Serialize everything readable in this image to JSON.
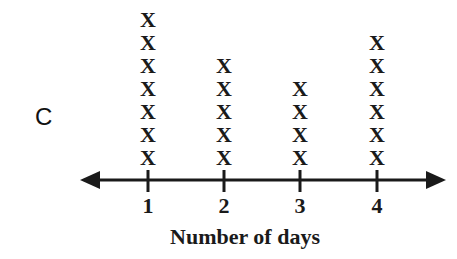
{
  "panel_label": "C",
  "chart_data": {
    "type": "line-plot",
    "marker": "X",
    "title": "",
    "xlabel": "Number of days",
    "ylabel": "",
    "categories": [
      "1",
      "2",
      "3",
      "4"
    ],
    "values": [
      7,
      5,
      4,
      6
    ],
    "axis": {
      "arrows": "both",
      "grid": false
    }
  },
  "layout": {
    "tick_x": [
      148,
      224,
      300,
      377
    ],
    "axis_y": 180,
    "x_spacing": 23,
    "bottom_x_top": 147
  }
}
